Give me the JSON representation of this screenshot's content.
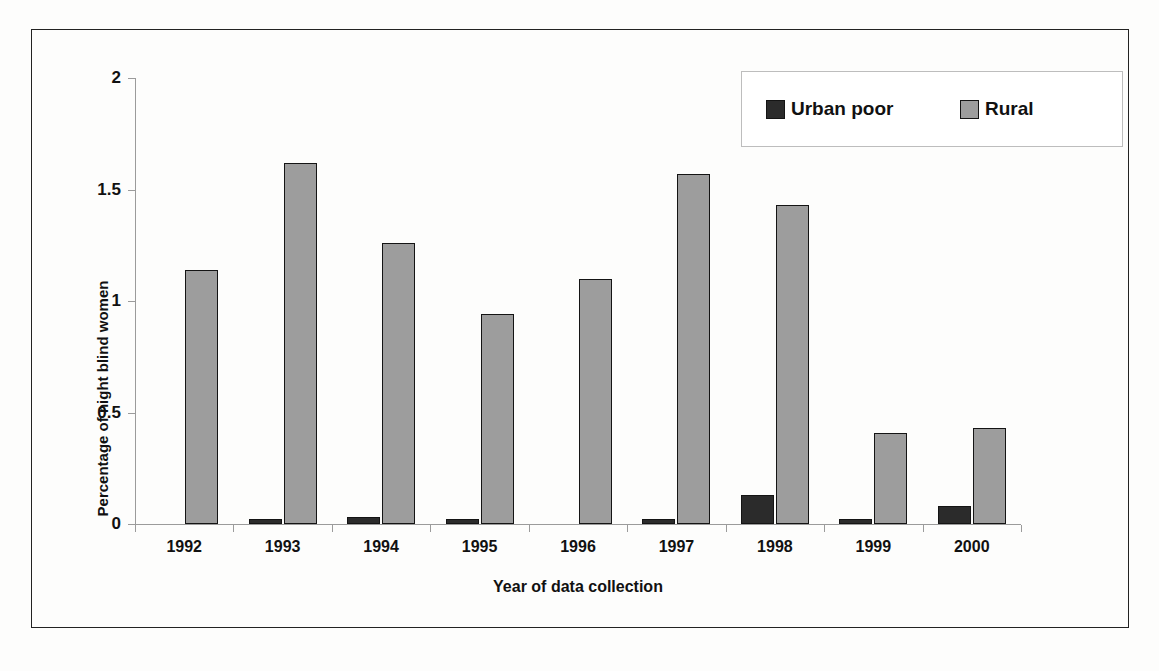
{
  "chart_data": {
    "type": "bar",
    "title": "",
    "subtitle": "",
    "xlabel": "Year of data collection",
    "ylabel": "Percentage of night blind women",
    "categories": [
      "1992",
      "1993",
      "1994",
      "1995",
      "1996",
      "1997",
      "1998",
      "1999",
      "2000"
    ],
    "ylim": [
      0,
      2
    ],
    "yticks": [
      "0",
      "0.5",
      "1",
      "1.5",
      "2"
    ],
    "ytick_values": [
      0,
      0.5,
      1,
      1.5,
      2
    ],
    "grid": false,
    "legend_position": "top-right",
    "series": [
      {
        "name": "Urban poor",
        "color": "#2b2b2b",
        "values": [
          null,
          0.02,
          0.03,
          0.01,
          null,
          0.02,
          0.13,
          0.01,
          0.08
        ]
      },
      {
        "name": "Rural",
        "color": "#9d9d9d",
        "values": [
          1.14,
          1.62,
          1.26,
          0.94,
          1.1,
          1.57,
          1.43,
          0.41,
          0.43
        ]
      }
    ]
  },
  "legend": {
    "items": [
      {
        "label": "Urban poor",
        "color": "#2b2b2b"
      },
      {
        "label": "Rural",
        "color": "#9d9d9d"
      }
    ]
  },
  "axes": {
    "y_title": "Percentage of night blind women",
    "x_title": "Year of data collection"
  }
}
